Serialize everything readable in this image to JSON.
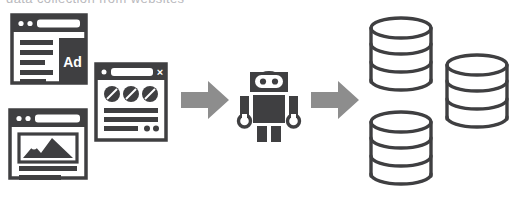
{
  "diagram": {
    "type": "process-flow",
    "background_color": "#ffffff",
    "dark_color": "#3f3f41",
    "arrow_color": "#8d8d8d",
    "partial_top_text": "data collection from websites",
    "steps": [
      {
        "id": "sources",
        "label": "Web pages",
        "icons": [
          "browser-window-ad",
          "browser-window-image",
          "browser-window-media"
        ]
      },
      {
        "id": "arrow-1",
        "label": "flows to",
        "icons": [
          "arrow-right-icon"
        ]
      },
      {
        "id": "scraper",
        "label": "Scraper bot",
        "icons": [
          "robot-icon"
        ]
      },
      {
        "id": "arrow-2",
        "label": "stores into",
        "icons": [
          "arrow-right-icon"
        ]
      },
      {
        "id": "storage",
        "label": "Databases",
        "icons": [
          "database-cylinder",
          "database-cylinder",
          "database-cylinder"
        ]
      }
    ],
    "windows": {
      "ad_window": {
        "name": "browser-window-ad",
        "ad_label": "Ad",
        "dot_count": 2,
        "text_line_count": 5
      },
      "image_window": {
        "name": "browser-window-image",
        "dot_count": 2,
        "text_line_count": 2
      },
      "media_window": {
        "name": "browser-window-media",
        "dot_count": 1,
        "close_glyph": "×",
        "circle_count": 3,
        "text_line_count": 3,
        "small_dot_count": 2
      }
    },
    "robot": {
      "name": "robot-icon",
      "eye_count": 2,
      "arm_count": 2,
      "leg_count": 2,
      "hand_count": 2
    },
    "databases": {
      "name": "database-cylinder",
      "count": 3,
      "layers_per_cylinder": 3
    }
  }
}
